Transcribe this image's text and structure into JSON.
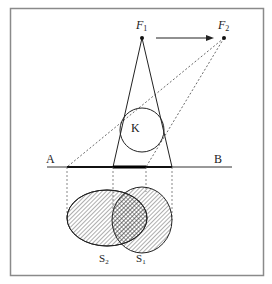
{
  "figure": {
    "type": "shadow-projection diagram",
    "labels": {
      "source1": "F",
      "source1_sub": "1",
      "source2": "F",
      "source2_sub": "2",
      "object": "K",
      "line_start": "A",
      "line_end": "B",
      "shadow2": "S",
      "shadow2_sub": "2",
      "shadow1": "S",
      "shadow1_sub": "1"
    },
    "colors": {
      "stroke": "#222222",
      "frame": "#8a8a8a",
      "background": "#ffffff"
    }
  }
}
